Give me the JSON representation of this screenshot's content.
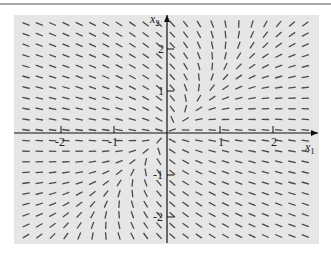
{
  "chart_data": {
    "type": "direction_field",
    "title": "",
    "xlabel": "x1",
    "ylabel": "x2",
    "xlim": [
      -2.9,
      2.9
    ],
    "ylim": [
      -2.8,
      2.8
    ],
    "xticks": [
      -2,
      -1,
      1,
      2
    ],
    "yticks": [
      2,
      1,
      -1,
      -2
    ],
    "xtick_labels": [
      "-2",
      "-1",
      "1",
      "2"
    ],
    "ytick_labels": [
      "2",
      "1",
      "-1",
      "-2"
    ],
    "grid": false,
    "system_matrix_estimate": [
      [
        -2,
        1
      ],
      [
        0.3,
        -1.2
      ]
    ],
    "field_grid": {
      "x_step": 0.25,
      "y_step": 0.25,
      "segment_color": "#4a4a4a"
    },
    "frame": {
      "background": "#e6e6e6"
    }
  },
  "axes": {
    "x_label_main": "x",
    "x_label_sub": "1",
    "y_label_main": "x",
    "y_label_sub": "2"
  }
}
